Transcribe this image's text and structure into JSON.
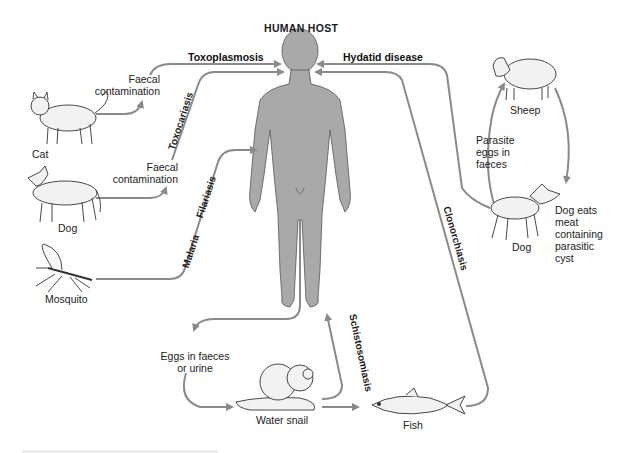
{
  "diagram": {
    "title": "HUMAN HOST",
    "colors": {
      "human_fill": "#a9a9a9",
      "arrow": "#8a8a8a",
      "animal_fill": "#f2f2f2",
      "outline": "#333333",
      "text": "#222222"
    },
    "sources": {
      "cat": "Cat",
      "dog_left": "Dog",
      "mosquito": "Mosquito",
      "sheep": "Sheep",
      "dog_right": "Dog",
      "water_snail": "Water snail",
      "fish": "Fish"
    },
    "notes": {
      "cat_faecal": "Faecal\ncontamination",
      "dog_faecal": "Faecal\ncontamination",
      "parasite_eggs": "Parasite\neggs in\nfaeces",
      "dog_eats": "Dog eats\nmeat\ncontaining\nparasitic\ncyst",
      "eggs_in_faeces": "Eggs in faeces\nor urine"
    },
    "diseases": {
      "toxoplasmosis": "Toxoplasmosis",
      "toxocariasis": "Toxocariasis",
      "filariasis": "Filariasis",
      "malaria": "Malaria",
      "hydatid": "Hydatid disease",
      "clonorchiasis": "Clonorchiasis",
      "schistosomiasis": "Schistosomiasis"
    }
  }
}
